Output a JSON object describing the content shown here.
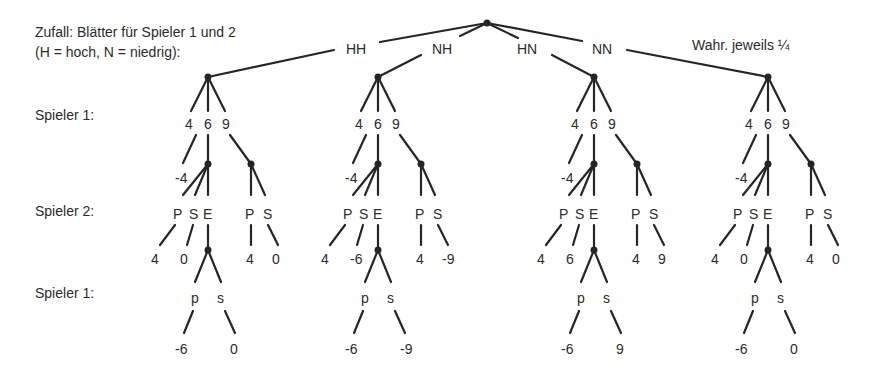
{
  "title": {
    "line1": "Zufall: Blätter für Spieler 1 und 2",
    "line2": "(H = hoch, N = niedrig):"
  },
  "probability_note": "Wahr. jeweils ¼",
  "row_labels": {
    "player1_first": "Spieler 1:",
    "player2": "Spieler 2:",
    "player1_second": "Spieler 1:"
  },
  "chance_branches": [
    {
      "label": "HH",
      "p1_choices": [
        "4",
        "6",
        "9"
      ],
      "payoff_after_4": "-4",
      "after_6": {
        "p2_choices": [
          "P",
          "S",
          "E"
        ],
        "payoff_P": "4",
        "payoff_S": "0",
        "after_E": {
          "p1_choices": [
            "p",
            "s"
          ],
          "payoff_p": "-6",
          "payoff_s": "0"
        }
      },
      "after_9": {
        "p2_choices": [
          "P",
          "S"
        ],
        "payoff_P": "4",
        "payoff_S": "0"
      }
    },
    {
      "label": "NH",
      "p1_choices": [
        "4",
        "6",
        "9"
      ],
      "payoff_after_4": "-4",
      "after_6": {
        "p2_choices": [
          "P",
          "S",
          "E"
        ],
        "payoff_P": "4",
        "payoff_S": "-6",
        "after_E": {
          "p1_choices": [
            "p",
            "s"
          ],
          "payoff_p": "-6",
          "payoff_s": "-9"
        }
      },
      "after_9": {
        "p2_choices": [
          "P",
          "S"
        ],
        "payoff_P": "4",
        "payoff_S": "-9"
      }
    },
    {
      "label": "HN",
      "p1_choices": [
        "4",
        "6",
        "9"
      ],
      "payoff_after_4": "-4",
      "after_6": {
        "p2_choices": [
          "P",
          "S",
          "E"
        ],
        "payoff_P": "4",
        "payoff_S": "6",
        "after_E": {
          "p1_choices": [
            "p",
            "s"
          ],
          "payoff_p": "-6",
          "payoff_s": "9"
        }
      },
      "after_9": {
        "p2_choices": [
          "P",
          "S"
        ],
        "payoff_P": "4",
        "payoff_S": "9"
      }
    },
    {
      "label": "NN",
      "p1_choices": [
        "4",
        "6",
        "9"
      ],
      "payoff_after_4": "-4",
      "after_6": {
        "p2_choices": [
          "P",
          "S",
          "E"
        ],
        "payoff_P": "4",
        "payoff_S": "0",
        "after_E": {
          "p1_choices": [
            "p",
            "s"
          ],
          "payoff_p": "-6",
          "payoff_s": "0"
        }
      },
      "after_9": {
        "p2_choices": [
          "P",
          "S"
        ],
        "payoff_P": "4",
        "payoff_S": "0"
      }
    }
  ],
  "colors": {
    "line": "#262626",
    "text": "#2b2b2b",
    "background": "#ffffff"
  }
}
